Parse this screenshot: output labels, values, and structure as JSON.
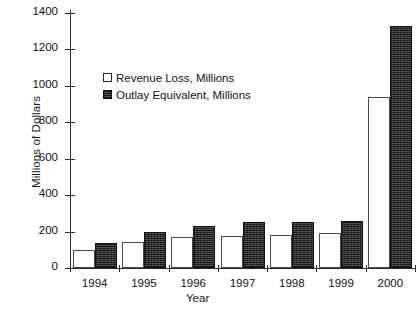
{
  "chart_data": {
    "type": "bar",
    "title": "",
    "xlabel": "Year",
    "ylabel": "Millions of Dollars",
    "categories": [
      "1994",
      "1995",
      "1996",
      "1997",
      "1998",
      "1999",
      "2000"
    ],
    "series": [
      {
        "name": "Revenue Loss, Millions",
        "color": "#ffffff",
        "values": [
          100,
          145,
          170,
          175,
          180,
          190,
          940
        ]
      },
      {
        "name": "Outlay Equivalent, Millions",
        "color": "#3b3b3b",
        "values": [
          140,
          200,
          230,
          250,
          250,
          260,
          1330
        ]
      }
    ],
    "ylim": [
      0,
      1400
    ],
    "ytick_labels": [
      "0",
      "200",
      "400",
      "600",
      "800",
      "1000",
      "1200",
      "1400"
    ],
    "ytick_values": [
      0,
      200,
      400,
      600,
      800,
      1000,
      1200,
      1400
    ],
    "grid": false,
    "legend_position": "upper-left-inside"
  },
  "legend": {
    "items": [
      {
        "label": "Revenue Loss, Millions",
        "marker": "hollow-square-icon"
      },
      {
        "label": "Outlay Equivalent, Millions",
        "marker": "filled-hatched-square-icon"
      }
    ]
  },
  "axes": {
    "y_title": "Millions of Dollars",
    "x_title": "Year"
  }
}
